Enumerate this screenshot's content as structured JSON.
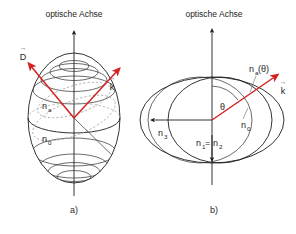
{
  "figure": {
    "background_color": "#ffffff",
    "axis_color": "#1d1d1d",
    "vector_color": "#d42020",
    "dashed_color": "#9a9a9a"
  },
  "panel_a": {
    "title": "optische Achse",
    "caption": "a)",
    "shape": "prolate index ellipsoid with latitude rings and dashed hidden contours",
    "vectors": [
      {
        "name": "D-vector",
        "label_base": "D",
        "label_accent": "→",
        "direction": "upper-left"
      },
      {
        "name": "k-vector",
        "label_base": "k",
        "label_accent": "→",
        "direction": "upper-right"
      }
    ],
    "index_labels": [
      {
        "name": "n-a-label",
        "base": "n",
        "sub": "a"
      },
      {
        "name": "n-0-label",
        "base": "n",
        "sub": "0"
      }
    ],
    "axis_name": "optical-axis-arrow"
  },
  "panel_b": {
    "title": "optische Achse",
    "caption": "b)",
    "shape": "nested index ellipses cross-section (wide outer ellipse, inner circle, tilted ellipse)",
    "angle": {
      "name": "theta-angle",
      "symbol": "θ"
    },
    "vectors": [
      {
        "name": "k-vector",
        "label_base": "k",
        "label_accent": "→",
        "direction": "upper-right"
      },
      {
        "name": "n3-arrow",
        "direction": "left"
      },
      {
        "name": "n1n2-arrow",
        "direction": "down"
      }
    ],
    "index_labels": [
      {
        "name": "na-theta-label",
        "base": "n",
        "sub": "a",
        "suffix": "(θ)"
      },
      {
        "name": "n-3-label",
        "base": "n",
        "sub": "3"
      },
      {
        "name": "n-0-label",
        "base": "n",
        "sub": "0"
      },
      {
        "name": "n1-equals-n2-label",
        "base": "n",
        "sub": "1",
        "equals": "=",
        "base2": "n",
        "sub2": "2"
      }
    ],
    "axis_name": "optical-axis-arrow"
  }
}
